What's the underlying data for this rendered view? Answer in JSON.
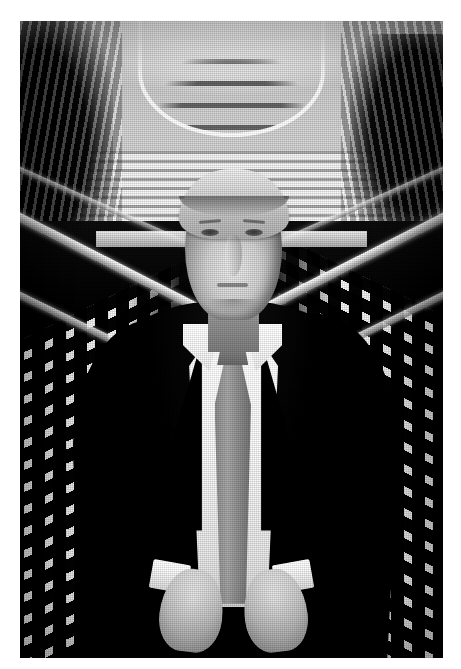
{
  "page": {
    "background_color": "#ffffff",
    "width": 461,
    "height": 669
  },
  "photo": {
    "name": "scanned-photograph",
    "caption": "",
    "alt_text": "Black and white photograph of a man in a dark suit, white shirt and gray tie standing with hands clasped in front of converging escalators inside a bright atrium",
    "medium": "black-and-white halftone print",
    "orientation": "portrait",
    "frame": {
      "left": 20,
      "top": 21,
      "width": 423,
      "height": 637
    },
    "palette": {
      "paper": "#ffffff",
      "highlight": "#ffffff",
      "midtone": "#9a9a9a",
      "shadow": "#0a0a0a",
      "skin": "#ddcdb9",
      "tie": "#8f8f8f",
      "suit": "#070707"
    },
    "subject": {
      "name": "man-in-suit",
      "pose": "standing, hands clasped at waist",
      "hair": "light blond, swept",
      "garments": [
        "dark suit jacket",
        "white dress shirt",
        "gray necktie",
        "white shirt cuffs"
      ]
    },
    "background": {
      "name": "atrium-escalators",
      "elements": [
        "curved skylight ribs",
        "ribbed balcony bands",
        "dark foliage mass upper left",
        "dark foliage mass upper right",
        "bright escalator handrails converging to center",
        "left escalator tread light rows",
        "right escalator tread light rows",
        "bright mid landing strip"
      ]
    }
  }
}
